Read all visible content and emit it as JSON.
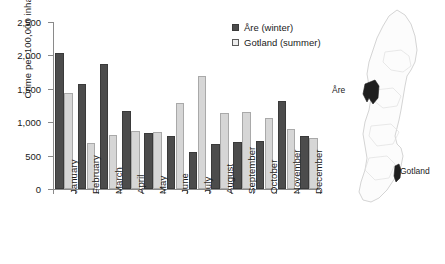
{
  "chart_data": {
    "type": "bar",
    "title": "",
    "xlabel": "",
    "ylabel": "Crime per 100,000 inhabitants",
    "ylim": [
      0,
      2500
    ],
    "yticks": [
      0,
      500,
      1000,
      1500,
      2000,
      2500
    ],
    "ytick_labels": [
      "0",
      "500",
      "1,000",
      "1,500",
      "2,000",
      "2,500"
    ],
    "grid": false,
    "legend_position": "top-right",
    "categories": [
      "January",
      "February",
      "March",
      "April",
      "May",
      "June",
      "July",
      "August",
      "September",
      "October",
      "November",
      "December"
    ],
    "series": [
      {
        "name": "Åre (winter)",
        "color": "#4c4c4c",
        "values": [
          2040,
          1565,
          1875,
          1165,
          845,
          790,
          560,
          680,
          700,
          720,
          1320,
          790
        ]
      },
      {
        "name": "Gotland (summer)",
        "color": "#d6d6d6",
        "values": [
          1435,
          690,
          815,
          870,
          855,
          1290,
          1695,
          1135,
          1150,
          1060,
          905,
          770
        ]
      }
    ]
  },
  "legend": {
    "entries": [
      {
        "label": "Åre (winter)",
        "swatch": "filled-dark-square"
      },
      {
        "label": "Gotland (summer)",
        "swatch": "open-light-square"
      }
    ]
  },
  "map": {
    "title": "sweden-outline-map",
    "annotations": [
      {
        "name": "Åre",
        "label": "Åre"
      },
      {
        "name": "Gotland",
        "label": "Gotland"
      }
    ]
  }
}
